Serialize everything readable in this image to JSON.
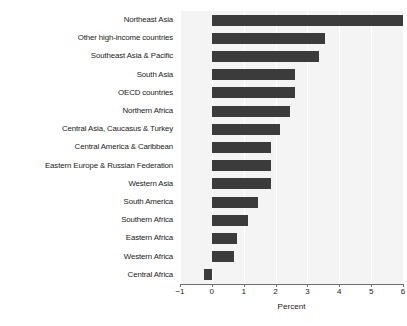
{
  "chart_data": {
    "type": "bar",
    "orientation": "horizontal",
    "title": "",
    "xlabel": "Percent",
    "ylabel": "",
    "xlim": [
      -1,
      6
    ],
    "xticks": [
      -1,
      0,
      1,
      2,
      3,
      4,
      5,
      6
    ],
    "xtick_labels": [
      "−1",
      "0",
      "1",
      "2",
      "3",
      "4",
      "5",
      "6"
    ],
    "grid": true,
    "grid_axis": "x",
    "legend": false,
    "bar_color": "#3b3b3b",
    "plot_background": "#f4f4f4",
    "categories": [
      "Northeast Asia",
      "Other high-income countries",
      "Southeast Asia & Pacific",
      "South Asia",
      "OECD countries",
      "Northern Africa",
      "Central Asia, Caucasus & Turkey",
      "Central America & Caribbean",
      "Eastern Europe & Russian Federation",
      "Western Asia",
      "South America",
      "Southern Africa",
      "Eastern Africa",
      "Western Africa",
      "Central Africa"
    ],
    "values": [
      6.0,
      3.55,
      3.35,
      2.6,
      2.6,
      2.45,
      2.15,
      1.85,
      1.85,
      1.85,
      1.45,
      1.15,
      0.8,
      0.7,
      -0.25
    ]
  }
}
